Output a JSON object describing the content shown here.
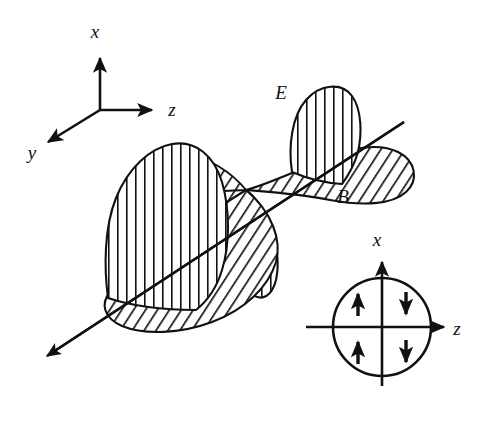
{
  "figure": {
    "background_color": "#ffffff",
    "stroke_color": "#111111",
    "width": 490,
    "height": 424
  },
  "main_axes": {
    "origin": {
      "x": 100,
      "y": 110
    },
    "labels": {
      "x": "x",
      "y": "y",
      "z": "z"
    },
    "x_axis": {
      "label": "x",
      "label_x": 95,
      "label_y": 38,
      "tip_x": 100,
      "tip_y": 55
    },
    "y_axis": {
      "label": "y",
      "label_x": 32,
      "label_y": 158,
      "tip_x": 42,
      "tip_y": 138
    },
    "z_axis": {
      "label": "z",
      "label_x": 172,
      "label_y": 116,
      "tip_x": 155,
      "tip_y": 110
    }
  },
  "wave": {
    "propagation_axis": {
      "start": {
        "x": 404,
        "y": 122
      },
      "end": {
        "x": 44,
        "y": 358
      },
      "arrow_at": "end"
    },
    "node_point": {
      "x": 246,
      "y": 190
    },
    "e_field": {
      "label": "E",
      "label_x": 281,
      "label_y": 98,
      "hatch": "vertical",
      "description": "Electric field lobes drawn with vertical hatching, oscillating along x"
    },
    "b_field": {
      "label": "B",
      "label_x": 343,
      "label_y": 202,
      "hatch": "diagonal",
      "description": "Magnetic field lobes drawn with diagonal hatching, oscillating along y"
    }
  },
  "inset": {
    "name": "cross-section-inset",
    "circle": {
      "cx": 382,
      "cy": 327,
      "r": 49
    },
    "labels": {
      "x": "x",
      "z": "z"
    },
    "x_axis": {
      "label": "x",
      "label_x": 377,
      "label_y": 244,
      "tip_y": 258,
      "base_y": 386
    },
    "z_axis": {
      "label": "z",
      "label_x": 456,
      "label_y": 334,
      "tip_x": 448,
      "base_x": 306
    },
    "arrows": [
      {
        "name": "quadrant-upper-left-arrow",
        "x": 358,
        "y": 303,
        "direction": "up"
      },
      {
        "name": "quadrant-upper-right-arrow",
        "x": 406,
        "y": 303,
        "direction": "down"
      },
      {
        "name": "quadrant-lower-left-arrow",
        "x": 358,
        "y": 352,
        "direction": "up"
      },
      {
        "name": "quadrant-lower-right-arrow",
        "x": 406,
        "y": 352,
        "direction": "down"
      }
    ]
  }
}
